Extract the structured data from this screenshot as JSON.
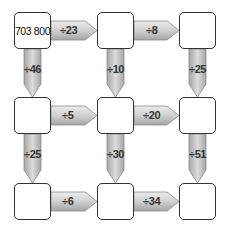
{
  "puzzle": {
    "grid": [
      [
        "703 800",
        "",
        ""
      ],
      [
        "",
        "",
        ""
      ],
      [
        "",
        "",
        ""
      ]
    ],
    "horizontal_operations": [
      [
        "÷23",
        "÷8"
      ],
      [
        "÷5",
        "÷20"
      ],
      [
        "÷6",
        "÷34"
      ]
    ],
    "vertical_operations": [
      [
        "÷46",
        "÷10",
        "÷25"
      ],
      [
        "÷25",
        "÷30",
        "÷51"
      ]
    ]
  },
  "colors": {
    "arrow_fill_light": "#e6e6e6",
    "arrow_fill_dark": "#a8a8a8",
    "arrow_stroke": "#8a8a8a",
    "box_border": "#333333"
  }
}
